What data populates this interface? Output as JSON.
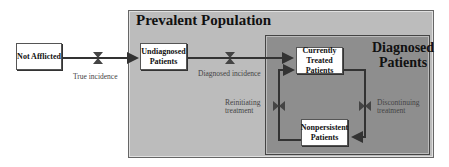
{
  "diagram": {
    "outer_container": {
      "title": "Prevalent Population",
      "color": "#bcbcbc"
    },
    "inner_container": {
      "title": "Diagnosed Patients",
      "color": "#8e8e8e"
    },
    "stocks": {
      "not_afflicted": "Not Afflicted",
      "undiagnosed": "Undiagnosed Patients",
      "currently_treated": "Currently Treated Patients",
      "nonpersistent": "Nonpersistent Patients"
    },
    "flows": {
      "true_incidence": "True incidence",
      "diagnosed_incidence": "Diagnosed incidence",
      "reinitiating": "Reinitiating treatment",
      "discontinuing": "Discontinuing treatment"
    }
  }
}
